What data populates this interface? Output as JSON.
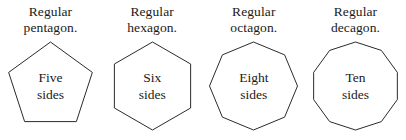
{
  "figure": {
    "background_color": "#ffffff",
    "stroke_color": "#2b2b2b",
    "fill_color": "#ffffff",
    "text_color": "#1a1a1a"
  },
  "polygons": [
    {
      "caption": "Regular\npentagon.",
      "inner_label": "Five\nsides",
      "sides": 5,
      "shape_name": "pentagon",
      "orientation": "point-up"
    },
    {
      "caption": "Regular\nhexagon.",
      "inner_label": "Six\nsides",
      "sides": 6,
      "shape_name": "hexagon",
      "orientation": "point-up"
    },
    {
      "caption": "Regular\noctagon.",
      "inner_label": "Eight\nsides",
      "sides": 8,
      "shape_name": "octagon",
      "orientation": "point-up"
    },
    {
      "caption": "Regular\ndecagon.",
      "inner_label": "Ten\nsides",
      "sides": 10,
      "shape_name": "decagon",
      "orientation": "point-up"
    }
  ]
}
